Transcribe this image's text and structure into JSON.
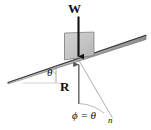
{
  "figure": {
    "background_color": "#ffffff",
    "labels": {
      "weight": "W",
      "reaction": "R",
      "incline_angle": "θ",
      "phi_equals_theta": "ϕ = θ",
      "normal_direction": "n"
    },
    "colors": {
      "line": "#3a3a3a",
      "block_fill": "#c9c9c9",
      "block_edge": "#6e6e6e",
      "incline_fill": "#bdbdbd",
      "arrow": "#111111",
      "thin_line": "#7a7a7a"
    },
    "geometry": {
      "incline_left_x": 8,
      "incline_left_y": 82,
      "incline_right_x": 146,
      "incline_right_y": 36,
      "contact_x": 79,
      "contact_y": 60,
      "block_width": 30,
      "block_height": 27,
      "weight_arrow_top_y": 16,
      "weight_arrow_bottom_y": 58,
      "reaction_arrow_top_y": 63,
      "reaction_arrow_bottom_y": 105,
      "normal_line_end_x": 112,
      "normal_line_end_y": 118,
      "theta_vertex_x": 43,
      "theta_vertex_y": 82
    },
    "elements": [
      {
        "name": "inclined-plane",
        "type": "line"
      },
      {
        "name": "block",
        "type": "parallelogram"
      },
      {
        "name": "weight-vector",
        "type": "arrow",
        "direction": "down"
      },
      {
        "name": "reaction-vector",
        "type": "arrow",
        "direction": "up"
      },
      {
        "name": "normal-direction-line",
        "type": "line"
      },
      {
        "name": "incline-angle-arc",
        "type": "arc"
      },
      {
        "name": "phi-angle-arc",
        "type": "arc"
      }
    ]
  }
}
